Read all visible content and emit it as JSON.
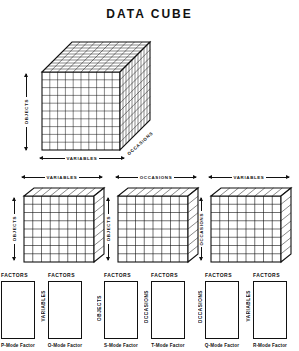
{
  "title": "DATA CUBE",
  "main_cube": {
    "name": "data-cube",
    "axes": {
      "vertical": "OBJECTS",
      "horizontal": "VARIABLES",
      "depth": "OCCASIONS"
    },
    "grid": {
      "cols": 10,
      "rows": 10,
      "depth": 10
    }
  },
  "slices": [
    {
      "id": "slice-objects-variables",
      "top_label": "VARIABLES",
      "side_label": "OBJECTS",
      "grid": {
        "cols": 8,
        "rows": 8
      }
    },
    {
      "id": "slice-objects-occasions",
      "top_label": "OCCASIONS",
      "side_label": "OBJECTS",
      "grid": {
        "cols": 8,
        "rows": 8
      }
    },
    {
      "id": "slice-occasions-variables",
      "top_label": "VARIABLES",
      "side_label": "OCCASIONS",
      "grid": {
        "cols": 8,
        "rows": 8
      }
    }
  ],
  "factor_matrices": [
    {
      "id": "factor-p-mode",
      "header": "FACTORS",
      "side_label": "",
      "caption": "P-Mode Factor"
    },
    {
      "id": "factor-o-mode",
      "header": "FACTORS",
      "side_label": "VARIABLES",
      "caption": "O-Mode Factor"
    },
    {
      "id": "factor-s-mode",
      "header": "FACTORS",
      "side_label": "OBJECTS",
      "caption": "S-Mode Factor"
    },
    {
      "id": "factor-t-mode",
      "header": "FACTORS",
      "side_label": "OCCASIONS",
      "caption": "T-Mode Factor"
    },
    {
      "id": "factor-q-mode",
      "header": "FACTORS",
      "side_label": "OCCASIONS",
      "caption": "Q-Mode Factor"
    },
    {
      "id": "factor-r-mode",
      "header": "FACTORS",
      "side_label": "VARIABLES",
      "caption": "R-Mode Factor"
    }
  ],
  "colors": {
    "ink": "#111111",
    "paper": "#ffffff"
  }
}
